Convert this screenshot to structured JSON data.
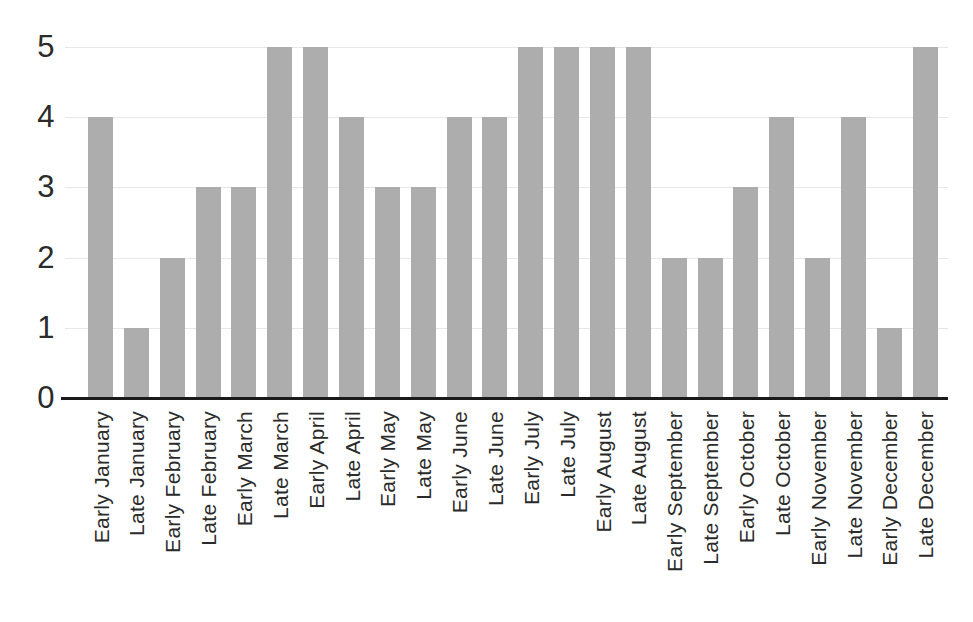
{
  "chart_data": {
    "type": "bar",
    "title": "",
    "xlabel": "",
    "ylabel": "",
    "categories": [
      "Early January",
      "Late January",
      "Early February",
      "Late February",
      "Early March",
      "Late March",
      "Early April",
      "Late April",
      "Early May",
      "Late May",
      "Early June",
      "Late June",
      "Early July",
      "Late July",
      "Early August",
      "Late August",
      "Early September",
      "Late September",
      "Early October",
      "Late October",
      "Early November",
      "Late November",
      "Early December",
      "Late December"
    ],
    "values": [
      4,
      1,
      2,
      3,
      3,
      5,
      5,
      4,
      3,
      3,
      4,
      4,
      5,
      5,
      5,
      5,
      2,
      2,
      3,
      4,
      2,
      4,
      1,
      5
    ],
    "ylim": [
      0,
      5
    ],
    "yticks": [
      0,
      1,
      2,
      3,
      4,
      5
    ],
    "grid": "horizontal-only",
    "legend_position": "none",
    "colors": {
      "bar_fill": "#ADADAD",
      "axis_line": "#1a1a1a",
      "gridline": "#e7e7e7",
      "tick_text": "#2b2b2b",
      "background": "#ffffff"
    }
  }
}
